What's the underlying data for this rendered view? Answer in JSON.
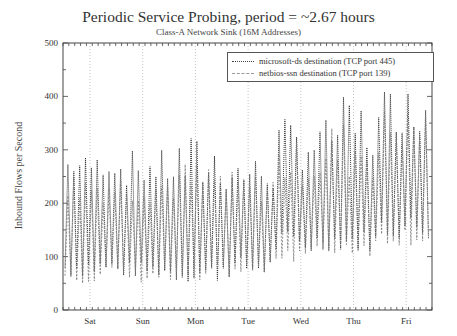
{
  "chart_data": {
    "type": "line",
    "title": "Periodic Service Probing, period = ~2.67 hours",
    "subtitle": "Class-A Network Sink (16M Addresses)",
    "xlabel": "",
    "ylabel": "Inbound Flows per Second",
    "ylim": [
      0,
      500
    ],
    "yticks": [
      0,
      100,
      200,
      300,
      400,
      500
    ],
    "xtick_labels": [
      "Sat",
      "Sun",
      "Mon",
      "Tue",
      "Wed",
      "Thu",
      "Fri"
    ],
    "grid": "vertical dotted lines at day boundaries",
    "legend_position": "upper right",
    "period_hours": 2.67,
    "series": [
      {
        "name": "microsoft-ds destination (TCP port 445)",
        "style": "dotted",
        "daily_peak_range": [
          [
            250,
            290
          ],
          [
            230,
            300
          ],
          [
            210,
            330
          ],
          [
            220,
            290
          ],
          [
            260,
            360
          ],
          [
            270,
            400
          ],
          [
            330,
            420
          ]
        ],
        "daily_trough_range": [
          [
            60,
            100
          ],
          [
            60,
            90
          ],
          [
            50,
            90
          ],
          [
            60,
            100
          ],
          [
            100,
            150
          ],
          [
            110,
            150
          ],
          [
            130,
            180
          ]
        ]
      },
      {
        "name": "netbios-ssn destination (TCP port 139)",
        "style": "dashed",
        "daily_peak_range": [
          [
            200,
            260
          ],
          [
            200,
            260
          ],
          [
            200,
            280
          ],
          [
            200,
            260
          ],
          [
            230,
            320
          ],
          [
            240,
            360
          ],
          [
            300,
            380
          ]
        ],
        "daily_trough_range": [
          [
            50,
            90
          ],
          [
            50,
            80
          ],
          [
            40,
            80
          ],
          [
            60,
            90
          ],
          [
            90,
            130
          ],
          [
            100,
            140
          ],
          [
            120,
            160
          ]
        ]
      }
    ]
  },
  "legend": {
    "items": [
      {
        "label": "microsoft-ds destination (TCP port 445)"
      },
      {
        "label": "netbios-ssn destination (TCP port 139)"
      }
    ]
  },
  "axes": {
    "y_ticks": [
      "0",
      "100",
      "200",
      "300",
      "400",
      "500"
    ],
    "x_ticks": [
      "Sat",
      "Sun",
      "Mon",
      "Tue",
      "Wed",
      "Thu",
      "Fri"
    ]
  }
}
